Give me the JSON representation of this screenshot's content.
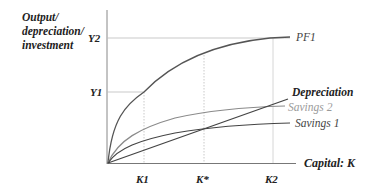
{
  "diagram": {
    "y_axis_label": [
      "Output/",
      "depreciation/",
      "investment"
    ],
    "x_axis_label": "Capital: K",
    "y_ticks": [
      {
        "label": "Y2",
        "y": 38
      },
      {
        "label": "Y1",
        "y": 92
      }
    ],
    "x_ticks": [
      {
        "label": "K1",
        "x": 144
      },
      {
        "label": "K*",
        "x": 204
      },
      {
        "label": "K2",
        "x": 273
      }
    ],
    "curves": [
      {
        "name": "PF1",
        "label": "PF1",
        "color": "#555555"
      },
      {
        "name": "Depreciation",
        "label": "Depreciation",
        "color": "#444444"
      },
      {
        "name": "Savings 2",
        "label": "Savings 2",
        "color": "#8a8a8a"
      },
      {
        "name": "Savings 1",
        "label": "Savings 1",
        "color": "#444444"
      }
    ]
  }
}
